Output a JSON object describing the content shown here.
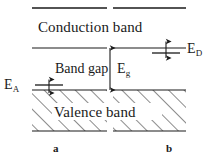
{
  "figure": {
    "background_color": "#ffffff",
    "line_color": "#1a1a1a",
    "width": 214,
    "height": 163
  },
  "labels": {
    "conduction_band": "Conduction band",
    "valence_band": "Valence band",
    "band_gap": "Band gap",
    "energy_gap_symbol": "E",
    "energy_gap_subscript": "g",
    "donor_level_symbol": "E",
    "donor_level_subscript": "D",
    "acceptor_level_symbol": "E",
    "acceptor_level_subscript": "A",
    "panel_a": "a",
    "panel_b": "b"
  },
  "geometry": {
    "panel_a": {
      "x_start": 32,
      "x_end": 107
    },
    "panel_b": {
      "x_start": 113,
      "x_end": 186
    },
    "conduction_band_top_y": 8,
    "conduction_band_edge_y": 48,
    "valence_band_edge_y": 90,
    "valence_band_bottom_y": 131,
    "donor_level_y": 53,
    "donor_level_x_start": 152,
    "donor_level_x_end": 180,
    "acceptor_level_y": 85,
    "acceptor_level_x_start": 35,
    "acceptor_level_x_end": 63,
    "band_gap_arrow_x": 110,
    "hatch_spacing": 11,
    "hatch_angle_deg": 45
  }
}
